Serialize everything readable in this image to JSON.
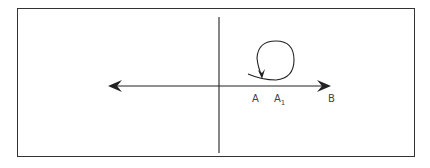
{
  "diagram": {
    "type": "rotation-on-line",
    "labels": {
      "a": "A",
      "a1_base": "A",
      "a1_sub": "1",
      "b": "B"
    },
    "elements": {
      "horizontal_axis": "double-headed arrow line",
      "vertical_axis": "vertical line",
      "loop": "circular arrow loop from A to A1"
    },
    "colors": {
      "stroke": "#222222",
      "label": "#444444",
      "background": "#ffffff"
    }
  }
}
